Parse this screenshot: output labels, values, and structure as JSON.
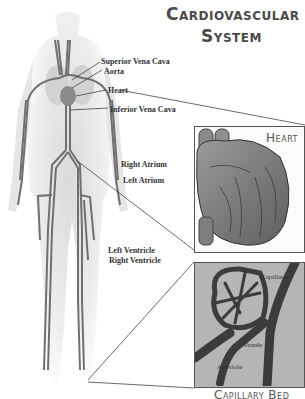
{
  "title": {
    "line1": "Cardiovascular",
    "line2": "System"
  },
  "body_labels": [
    {
      "id": "superior-vena-cava",
      "text": "Superior Vena Cava"
    },
    {
      "id": "aorta",
      "text": "Aorta"
    },
    {
      "id": "heart",
      "text": "Heart"
    },
    {
      "id": "inferior-vena-cava",
      "text": "Inferior Vena Cava"
    }
  ],
  "heart_panel": {
    "title": "Heart",
    "labels": [
      {
        "id": "right-atrium",
        "text": "Right Atrium"
      },
      {
        "id": "left-atrium",
        "text": "Left Atrium"
      },
      {
        "id": "left-ventricle",
        "text": "Left Ventricle"
      },
      {
        "id": "right-ventricle",
        "text": "Right Ventricle"
      }
    ]
  },
  "capillary_panel": {
    "title": "Capillary Bed",
    "labels": [
      {
        "id": "capillaries",
        "text": "Capillaries"
      },
      {
        "id": "venule",
        "text": "Venule"
      },
      {
        "id": "arteriole",
        "text": "Arteriole"
      }
    ]
  },
  "colors": {
    "vessel": "#6e6e6e",
    "body_shade": "#e2e2e2",
    "text": "#333333",
    "title": "#4a4a4a",
    "capillary_bg": "#b5b5b5",
    "capillary_vessel": "#3c3c3c"
  }
}
